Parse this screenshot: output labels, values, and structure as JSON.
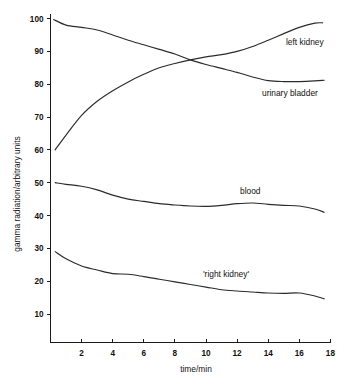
{
  "chart_data": {
    "type": "line",
    "title": "",
    "xlabel": "time/min",
    "ylabel": "gamma radiation/arbitrary units",
    "xlim": [
      0,
      18
    ],
    "ylim": [
      0,
      100
    ],
    "grid": false,
    "legend": "inline-labels",
    "xticks": [
      2,
      4,
      6,
      8,
      10,
      12,
      14,
      16,
      18
    ],
    "xtick_labels": [
      "2",
      "4",
      "6",
      "8",
      "10",
      "12",
      "14",
      "16",
      "18"
    ],
    "yticks": [
      10,
      20,
      30,
      40,
      50,
      60,
      70,
      80,
      90,
      100
    ],
    "ytick_labels": [
      "10",
      "20",
      "30",
      "40",
      "50",
      "60",
      "70",
      "80",
      "90",
      "100"
    ],
    "series": [
      {
        "name": "left kidney",
        "label": "left kidney",
        "color": "#2b2b2b",
        "x": [
          0.3,
          1.0,
          2.0,
          3.0,
          4.0,
          5.0,
          6.0,
          7.0,
          8.0,
          9.0,
          10.0,
          11.0,
          12.0,
          13.0,
          14.0,
          15.0,
          16.0,
          17.0,
          17.5
        ],
        "y": [
          60.0,
          64.5,
          70.5,
          74.8,
          78.0,
          80.7,
          83.0,
          85.0,
          86.3,
          87.4,
          88.3,
          89.0,
          90.0,
          91.5,
          93.4,
          95.4,
          97.3,
          98.6,
          98.7
        ]
      },
      {
        "name": "urinary bladder",
        "label": "urinary bladder",
        "color": "#2b2b2b",
        "x": [
          0.2,
          1.0,
          2.0,
          3.0,
          4.0,
          5.0,
          6.0,
          7.0,
          8.0,
          9.0,
          10.0,
          11.0,
          12.0,
          13.0,
          14.0,
          15.0,
          16.0,
          17.0,
          17.6
        ],
        "y": [
          99.7,
          98.0,
          97.3,
          96.5,
          95.0,
          93.4,
          92.0,
          90.6,
          89.2,
          87.4,
          86.0,
          84.8,
          83.6,
          82.2,
          81.1,
          80.8,
          80.8,
          81.0,
          81.2
        ]
      },
      {
        "name": "blood",
        "label": "blood",
        "color": "#2b2b2b",
        "x": [
          0.3,
          1.0,
          2.0,
          3.0,
          4.0,
          5.0,
          6.0,
          7.0,
          8.0,
          9.0,
          10.0,
          11.0,
          12.0,
          13.0,
          14.0,
          15.0,
          16.0,
          17.0,
          17.6
        ],
        "y": [
          50.0,
          49.5,
          48.9,
          47.8,
          46.2,
          45.0,
          44.3,
          43.6,
          43.2,
          42.9,
          42.8,
          43.1,
          43.6,
          43.8,
          43.4,
          43.1,
          42.9,
          42.0,
          41.0
        ]
      },
      {
        "name": "right kidney",
        "label": "'right kidney'",
        "color": "#2b2b2b",
        "x": [
          0.3,
          1.0,
          2.0,
          3.0,
          4.0,
          5.0,
          6.0,
          7.0,
          8.0,
          9.0,
          10.0,
          11.0,
          12.0,
          13.0,
          14.0,
          15.0,
          16.0,
          17.0,
          17.6
        ],
        "y": [
          29.0,
          26.8,
          24.6,
          23.4,
          22.3,
          22.1,
          21.4,
          20.6,
          19.8,
          19.0,
          18.2,
          17.4,
          17.0,
          16.7,
          16.4,
          16.3,
          16.4,
          15.5,
          14.6
        ]
      }
    ],
    "series_label_positions": [
      {
        "name": "left kidney",
        "x": 286,
        "y": 45
      },
      {
        "name": "urinary bladder",
        "x": 262,
        "y": 96
      },
      {
        "name": "blood",
        "x": 240,
        "y": 194
      },
      {
        "name": "right kidney",
        "x": 203,
        "y": 277
      }
    ]
  }
}
